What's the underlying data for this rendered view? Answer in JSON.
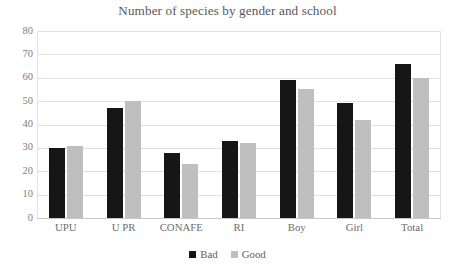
{
  "chart_data": {
    "type": "bar",
    "title": "Number of species by gender and school",
    "xlabel": "",
    "ylabel": "",
    "categories": [
      "UPU",
      "U PR",
      "CONAFE",
      "RI",
      "Boy",
      "Girl",
      "Total"
    ],
    "series": [
      {
        "name": "Bad",
        "color": "#161616",
        "values": [
          30,
          47,
          28,
          33,
          59,
          49,
          66
        ]
      },
      {
        "name": "Good",
        "color": "#bfbfbf",
        "values": [
          31,
          50,
          23,
          32,
          55,
          42,
          60
        ]
      }
    ],
    "ylim": [
      0,
      80
    ],
    "ytick_labels": [
      "80",
      "70",
      "60",
      "50",
      "40",
      "30",
      "20",
      "10",
      "0"
    ],
    "ytick_values": [
      80,
      70,
      60,
      50,
      40,
      30,
      20,
      10,
      0
    ],
    "grid": true,
    "legend_position": "bottom"
  }
}
